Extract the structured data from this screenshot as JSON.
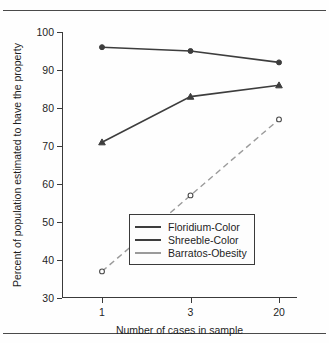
{
  "chart_data": {
    "type": "line",
    "title": "",
    "xlabel": "Number of cases in sample",
    "ylabel": "Percent of population estimated to have the property",
    "categories": [
      "1",
      "3",
      "20"
    ],
    "ylim": [
      30,
      100
    ],
    "yticks": [
      30,
      40,
      50,
      60,
      70,
      80,
      90,
      100
    ],
    "grid": false,
    "legend_position": "inside-lower-right",
    "series": [
      {
        "name": "Floridium-Color",
        "values": [
          96,
          95,
          92
        ],
        "color": "#3d3d3d",
        "style": "solid",
        "marker": "circle"
      },
      {
        "name": "Shreeble-Color",
        "values": [
          71,
          83,
          86
        ],
        "color": "#3d3d3d",
        "style": "solid",
        "marker": "triangle"
      },
      {
        "name": "Barratos-Obesity",
        "values": [
          37,
          57,
          77
        ],
        "color": "#9a9a9a",
        "style": "dashed",
        "marker": "open-circle"
      }
    ]
  },
  "axis": {
    "y_tick_labels": [
      "100",
      "90",
      "80",
      "70",
      "60",
      "50",
      "40",
      "30"
    ],
    "x_tick_labels": [
      "1",
      "3",
      "20"
    ],
    "x_title": "Number of cases in sample",
    "y_title": "Percent of population estimated to have the property"
  },
  "legend": {
    "items": [
      {
        "label": "Floridium-Color"
      },
      {
        "label": "Shreeble-Color"
      },
      {
        "label": "Barratos-Obesity"
      }
    ]
  }
}
